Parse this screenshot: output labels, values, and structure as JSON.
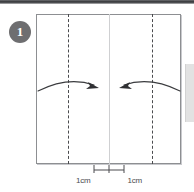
{
  "diagram": {
    "step_number": "1",
    "type": "origami-fold-instruction",
    "colors": {
      "paper_outline": "#8d8f92",
      "fold_line": "#4a4b4e",
      "center_line": "#cfd0d2",
      "arrow": "#3a3b3e",
      "badge_bg": "#6e6e70",
      "badge_text": "#ffffff",
      "edge_strip": "#e2e2e2",
      "top_rule": "#3c3d40"
    },
    "paper": {
      "shape": "square-sheet",
      "fold_lines": [
        {
          "name": "left-fold-line",
          "style": "dashed"
        },
        {
          "name": "right-fold-line",
          "style": "dashed"
        }
      ],
      "center_line": {
        "name": "center-line",
        "style": "solid-light"
      }
    },
    "arrows": [
      {
        "name": "left-fold-arrow",
        "direction": "right",
        "style": "curved"
      },
      {
        "name": "right-fold-arrow",
        "direction": "left",
        "style": "curved"
      }
    ],
    "measurements": {
      "left_label": "1cm",
      "right_label": "1cm"
    }
  }
}
